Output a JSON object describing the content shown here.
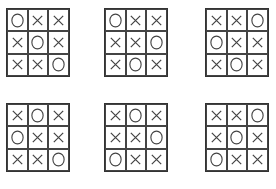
{
  "boards": [
    {
      "cells": [
        "O",
        "X",
        "X",
        "X",
        "O",
        "X",
        "X",
        "X",
        "O"
      ]
    },
    {
      "cells": [
        "O",
        "X",
        "X",
        "X",
        "X",
        "O",
        "X",
        "O",
        "X"
      ]
    },
    {
      "cells": [
        "X",
        "X",
        "O",
        "O",
        "X",
        "X",
        "X",
        "O",
        "X"
      ]
    },
    {
      "cells": [
        "X",
        "O",
        "X",
        "O",
        "X",
        "X",
        "X",
        "X",
        "O"
      ]
    },
    {
      "cells": [
        "X",
        "O",
        "X",
        "X",
        "X",
        "O",
        "O",
        "X",
        "X"
      ]
    },
    {
      "cells": [
        "X",
        "X",
        "O",
        "X",
        "O",
        "X",
        "O",
        "X",
        "X"
      ]
    }
  ],
  "positions": [
    {
      "left": 6,
      "top": 8
    },
    {
      "left": 104,
      "top": 8
    },
    {
      "left": 205,
      "top": 8
    },
    {
      "left": 6,
      "top": 103
    },
    {
      "left": 104,
      "top": 103
    },
    {
      "left": 205,
      "top": 103
    }
  ],
  "colors": {
    "stroke": "#444444"
  }
}
